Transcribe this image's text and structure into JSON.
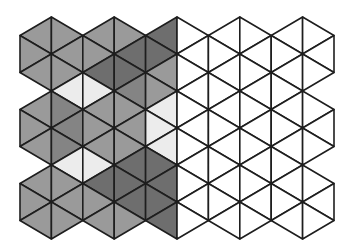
{
  "figure": {
    "grid": {
      "x0": 20,
      "dx": 31.4,
      "y0": 17,
      "dy_half": 18.5,
      "columns": 11,
      "strips": 10,
      "triangles_per_strip": 11,
      "notches": [
        [
          0,
          4
        ],
        [
          0,
          8
        ],
        [
          9,
          4
        ],
        [
          9,
          8
        ]
      ]
    },
    "palette": {
      "M": "#9a9a9a",
      "MD": "#848484",
      "D": "#6e6e6e",
      "L": "#ececec",
      "W": "#ffffff"
    },
    "line_color": "#1e1e1e",
    "shading": [
      [
        "M",
        "M",
        "M",
        null,
        "M",
        "M",
        "M",
        null,
        "M",
        "M",
        "M"
      ],
      [
        "M",
        "M",
        "M",
        "L",
        "MD",
        "MD",
        "MD",
        "L",
        "M",
        "M",
        "M"
      ],
      [
        "M",
        "M",
        "D",
        "L",
        "M",
        "M",
        "M",
        "L",
        "D",
        "M",
        "M"
      ],
      [
        "M",
        "D",
        "D",
        "MD",
        "M",
        "M",
        "M",
        "D",
        "D",
        "D",
        "M"
      ],
      [
        "D",
        "D",
        "M",
        "M",
        "L",
        "L",
        "L",
        "D",
        "D",
        "D",
        "D"
      ],
      [
        "W",
        "W",
        "W",
        "W",
        "W",
        "W",
        "W",
        "W",
        "W",
        "W",
        "W"
      ],
      [
        "W",
        "W",
        "W",
        "W",
        "W",
        "W",
        "W",
        "W",
        "W",
        "W",
        "W"
      ],
      [
        "W",
        "W",
        "W",
        "W",
        "W",
        "W",
        "W",
        "W",
        "W",
        "W",
        "W"
      ],
      [
        "W",
        "W",
        "W",
        "W",
        "W",
        "W",
        "W",
        "W",
        "W",
        "W",
        "W"
      ],
      [
        "W",
        "W",
        "W",
        null,
        "W",
        "W",
        "W",
        null,
        "W",
        "W",
        "W"
      ]
    ]
  }
}
